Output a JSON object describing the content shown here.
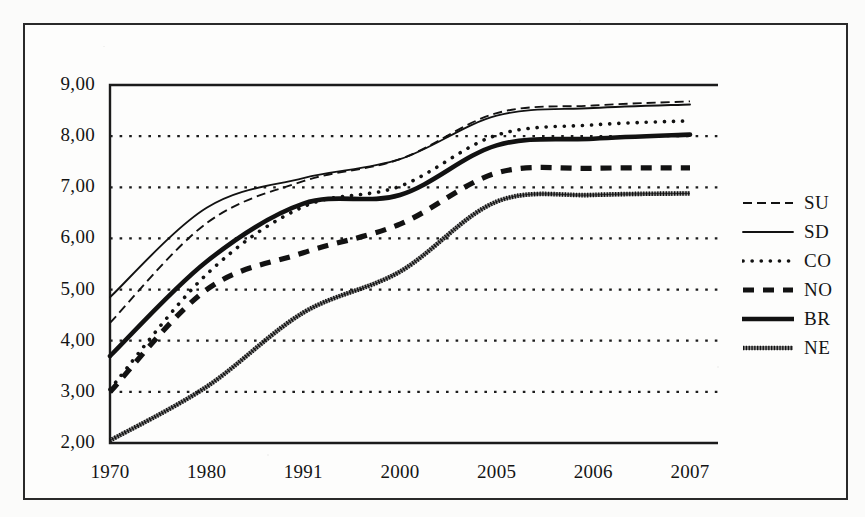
{
  "chart_data": {
    "type": "line",
    "title": "",
    "xlabel": "",
    "ylabel": "",
    "categories": [
      "1970",
      "1980",
      "1991",
      "2000",
      "2005",
      "2006",
      "2007"
    ],
    "ylim": [
      2.0,
      9.0
    ],
    "ytick_labels": [
      "9,00",
      "8,00",
      "7,00",
      "6,00",
      "5,00",
      "4,00",
      "3,00",
      "2,00"
    ],
    "ytick_values": [
      9.0,
      8.0,
      7.0,
      6.0,
      5.0,
      4.0,
      3.0,
      2.0
    ],
    "grid": true,
    "grid_style": "dotted-horizontal",
    "legend_position": "right",
    "series": [
      {
        "name": "SU",
        "style": "thin-dashed",
        "values": [
          4.35,
          6.3,
          7.12,
          7.55,
          8.45,
          8.6,
          8.68
        ]
      },
      {
        "name": "SD",
        "style": "thin-solid",
        "values": [
          4.85,
          6.6,
          7.18,
          7.55,
          8.4,
          8.55,
          8.62
        ]
      },
      {
        "name": "CO",
        "style": "dotted",
        "values": [
          3.05,
          5.3,
          6.62,
          7.02,
          8.02,
          8.22,
          8.3
        ]
      },
      {
        "name": "NO",
        "style": "thick-dashed",
        "values": [
          3.0,
          5.0,
          5.72,
          6.28,
          7.28,
          7.37,
          7.38
        ]
      },
      {
        "name": "BR",
        "style": "thick-solid",
        "values": [
          3.7,
          5.55,
          6.68,
          6.85,
          7.82,
          7.95,
          8.03
        ]
      },
      {
        "name": "NE",
        "style": "hatched",
        "values": [
          2.05,
          3.1,
          4.55,
          5.35,
          6.72,
          6.85,
          6.88
        ]
      }
    ]
  },
  "legend": {
    "items": [
      {
        "label": "SU"
      },
      {
        "label": "SD"
      },
      {
        "label": "CO"
      },
      {
        "label": "NO"
      },
      {
        "label": "BR"
      },
      {
        "label": "NE"
      }
    ]
  },
  "colors": {
    "ink": "#141414",
    "frame": "#2a2a2a",
    "grid": "#1d1d1d",
    "background": "#fdfdfc"
  }
}
